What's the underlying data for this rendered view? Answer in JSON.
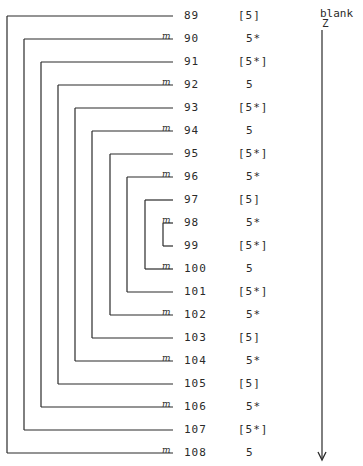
{
  "side_label": {
    "line1": "blank",
    "line2": "Z"
  },
  "rows": [
    {
      "num": "89",
      "val": "[5]",
      "mark": ""
    },
    {
      "num": "90",
      "val": "5*",
      "mark": "m"
    },
    {
      "num": "91",
      "val": "[5*]",
      "mark": ""
    },
    {
      "num": "92",
      "val": "5",
      "mark": "m"
    },
    {
      "num": "93",
      "val": "[5*]",
      "mark": ""
    },
    {
      "num": "94",
      "val": "5",
      "mark": "m"
    },
    {
      "num": "95",
      "val": "[5*]",
      "mark": ""
    },
    {
      "num": "96",
      "val": "5*",
      "mark": "m"
    },
    {
      "num": "97",
      "val": "[5]",
      "mark": ""
    },
    {
      "num": "98",
      "val": "5*",
      "mark": "m"
    },
    {
      "num": "99",
      "val": "[5*]",
      "mark": ""
    },
    {
      "num": "100",
      "val": "5",
      "mark": "m"
    },
    {
      "num": "101",
      "val": "[5*]",
      "mark": ""
    },
    {
      "num": "102",
      "val": "5*",
      "mark": "m"
    },
    {
      "num": "103",
      "val": "[5]",
      "mark": ""
    },
    {
      "num": "104",
      "val": "5*",
      "mark": "m"
    },
    {
      "num": "105",
      "val": "[5]",
      "mark": ""
    },
    {
      "num": "106",
      "val": "5*",
      "mark": "m"
    },
    {
      "num": "107",
      "val": "[5*]",
      "mark": ""
    },
    {
      "num": "108",
      "val": "5",
      "mark": "m"
    }
  ],
  "brackets": [
    {
      "top": "89",
      "bottom": "108"
    },
    {
      "top": "90",
      "bottom": "107"
    },
    {
      "top": "91",
      "bottom": "106"
    },
    {
      "top": "92",
      "bottom": "105"
    },
    {
      "top": "93",
      "bottom": "104"
    },
    {
      "top": "94",
      "bottom": "103"
    },
    {
      "top": "95",
      "bottom": "102"
    },
    {
      "top": "96",
      "bottom": "101"
    },
    {
      "top": "97",
      "bottom": "100"
    },
    {
      "top": "98",
      "bottom": "99"
    }
  ],
  "arrow": {
    "direction": "down"
  }
}
